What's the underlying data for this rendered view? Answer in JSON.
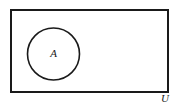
{
  "figure": {
    "type": "venn-diagram",
    "background_color": "#ffffff",
    "stroke_color": "#1a1a1a",
    "text_color": "#1a1a1a"
  },
  "universal_set": {
    "label": "U",
    "shape": "rectangle",
    "x": 11,
    "y": 10,
    "width": 157,
    "height": 82,
    "stroke_width": 2,
    "label_x": 165,
    "label_y": 102
  },
  "set_a": {
    "label": "A",
    "shape": "circle",
    "cx": 53.5,
    "cy": 54,
    "r": 26,
    "stroke_width": 1.6,
    "label_x": 53.5,
    "label_y": 57
  }
}
